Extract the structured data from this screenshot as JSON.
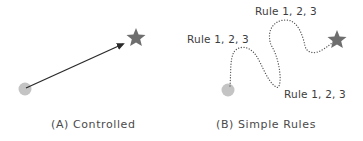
{
  "panels": [
    {
      "id": "A",
      "caption": "(A) Controlled",
      "start_marker": "gray-circle",
      "goal_marker": "star",
      "connector": "solid-arrow"
    },
    {
      "id": "B",
      "caption": "(B) Simple Rules",
      "start_marker": "gray-circle",
      "goal_marker": "star",
      "connector": "dotted-winding-path",
      "rule_labels": [
        "Rule 1, 2, 3",
        "Rule 1, 2, 3",
        "Rule 1, 2, 3"
      ]
    }
  ],
  "colors": {
    "circle": "#c4c4c4",
    "star": "#6e6e6e",
    "arrow": "#2a2a2a",
    "dotted_path": "#555555",
    "text": "#3c3c3c"
  }
}
